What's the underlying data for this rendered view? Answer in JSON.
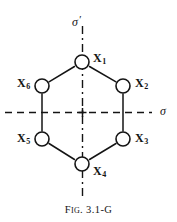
{
  "figure": {
    "caption_prefix": "F",
    "caption_smallcaps": "IG",
    "caption_rest": ". 3.1-G",
    "caption_full": "FIG. 3.1-G",
    "shape": "hexagon",
    "line_color": "#141414",
    "background_color": "#ffffff"
  },
  "axes": [
    {
      "id": "sigma-prime",
      "label": "σ",
      "prime": "′",
      "orientation": "vertical",
      "style": "dash-dot"
    },
    {
      "id": "sigma",
      "label": "σ",
      "prime": "",
      "orientation": "horizontal",
      "style": "dashed"
    }
  ],
  "vertices": [
    {
      "id": "x1",
      "base": "X",
      "sub": "1",
      "label": "X₁",
      "cx": 82,
      "cy": 62,
      "label_x": 93,
      "label_y": 54
    },
    {
      "id": "x2",
      "base": "X",
      "sub": "2",
      "label": "X₂",
      "cx": 123,
      "cy": 86,
      "label_x": 135,
      "label_y": 79
    },
    {
      "id": "x3",
      "base": "X",
      "sub": "3",
      "label": "X₃",
      "cx": 123,
      "cy": 139,
      "label_x": 135,
      "label_y": 134
    },
    {
      "id": "x4",
      "base": "X",
      "sub": "4",
      "label": "X₄",
      "cx": 82,
      "cy": 164,
      "label_x": 93,
      "label_y": 166
    },
    {
      "id": "x5",
      "base": "X",
      "sub": "5",
      "label": "X₅",
      "cx": 42,
      "cy": 139,
      "label_x": 18,
      "label_y": 134
    },
    {
      "id": "x6",
      "base": "X",
      "sub": "6",
      "label": "X₆",
      "cx": 42,
      "cy": 86,
      "label_x": 18,
      "label_y": 79
    }
  ],
  "bonds": [
    {
      "from": "x1",
      "to": "x2"
    },
    {
      "from": "x2",
      "to": "x3"
    },
    {
      "from": "x3",
      "to": "x4"
    },
    {
      "from": "x4",
      "to": "x5"
    },
    {
      "from": "x5",
      "to": "x6"
    },
    {
      "from": "x6",
      "to": "x1"
    }
  ]
}
